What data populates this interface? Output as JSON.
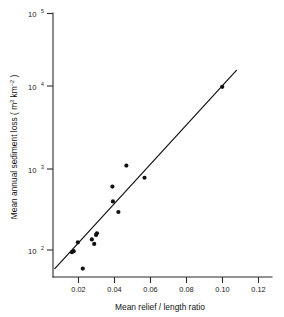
{
  "chart_data": {
    "type": "scatter",
    "title": "",
    "xlabel": "Mean relief / length ratio",
    "ylabel": "Mean annual sediment loss (m3 km-2)",
    "ylabel_parts": {
      "prefix": "Mean annual sediment loss ( m",
      "sup1": "3",
      "middle": " km",
      "sup2": "−2",
      "suffix": " )"
    },
    "grid": false,
    "legend": "none",
    "xscale": "linear",
    "yscale": "log",
    "xlim": [
      0.0068,
      0.1274
    ],
    "ylim": [
      45,
      130000
    ],
    "xticks": [
      0.02,
      0.04,
      0.06,
      0.08,
      0.1,
      0.12
    ],
    "xtick_labels": [
      "0.02",
      "0.04",
      "0.06",
      "0.08",
      "0.10",
      "0.12"
    ],
    "yticks": [
      100,
      1000,
      10000,
      100000
    ],
    "ytick_labels": [
      "10^2",
      "10^3",
      "10^4",
      "10^5"
    ],
    "ytick_bases": [
      "10",
      "10",
      "10",
      "10"
    ],
    "ytick_exponents": [
      "2",
      "3",
      "4",
      "5"
    ],
    "points": [
      {
        "x": 0.0172,
        "y": 95
      },
      {
        "x": 0.0182,
        "y": 98
      },
      {
        "x": 0.0205,
        "y": 128
      },
      {
        "x": 0.0232,
        "y": 58
      },
      {
        "x": 0.0282,
        "y": 140
      },
      {
        "x": 0.0295,
        "y": 122
      },
      {
        "x": 0.0305,
        "y": 160
      },
      {
        "x": 0.031,
        "y": 168
      },
      {
        "x": 0.0395,
        "y": 690
      },
      {
        "x": 0.0398,
        "y": 440
      },
      {
        "x": 0.0428,
        "y": 320
      },
      {
        "x": 0.0472,
        "y": 1300
      },
      {
        "x": 0.0572,
        "y": 900
      },
      {
        "x": 0.1,
        "y": 14000
      }
    ],
    "trend_line": {
      "label": "regression line",
      "x_start": 0.0078,
      "y_start": 58,
      "x_end": 0.1078,
      "y_end": 23000
    }
  }
}
